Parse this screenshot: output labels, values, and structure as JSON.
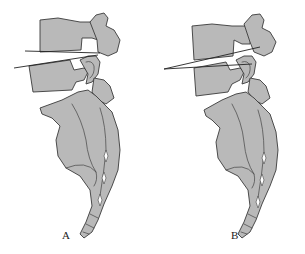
{
  "figure": {
    "type": "anatomical-illustration",
    "colors": {
      "bone_fill": "#b9b9b9",
      "outline": "#3a3a3a",
      "background": "#ffffff"
    },
    "panels": [
      {
        "label": "A",
        "description": "lumbosacral spine with two near-parallel angle lines through upper disc space"
      },
      {
        "label": "B",
        "description": "lumbosacral spine with two converging angle lines through upper disc space"
      }
    ]
  }
}
